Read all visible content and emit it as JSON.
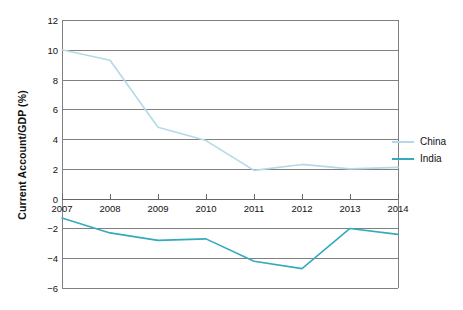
{
  "chart_data": {
    "type": "line",
    "title": "",
    "xlabel": "",
    "ylabel": "Current Account/GDP (%)",
    "categories": [
      "2007",
      "2008",
      "2009",
      "2010",
      "2011",
      "2012",
      "2013",
      "2014"
    ],
    "x": [
      2007,
      2008,
      2009,
      2010,
      2011,
      2012,
      2013,
      2014
    ],
    "ylim": [
      -6,
      12
    ],
    "xlim": [
      2007,
      2014
    ],
    "yticks": [
      12,
      10,
      8,
      6,
      4,
      2,
      0,
      -2,
      -4,
      -6
    ],
    "ytick_labels": [
      "12",
      "10",
      "8",
      "6",
      "4",
      "2",
      "0",
      "−2",
      "−4",
      "−6"
    ],
    "grid": true,
    "legend_position": "right",
    "series": [
      {
        "name": "China",
        "color": "#b5d9e8",
        "values": [
          10.0,
          9.3,
          4.8,
          3.9,
          1.9,
          2.3,
          2.0,
          2.1
        ]
      },
      {
        "name": "India",
        "color": "#35a9bd",
        "values": [
          -1.3,
          -2.3,
          -2.8,
          -2.7,
          -4.2,
          -4.7,
          -2.0,
          -2.4
        ]
      }
    ]
  },
  "legend": {
    "items": [
      {
        "label": "China",
        "color": "#b5d9e8"
      },
      {
        "label": "India",
        "color": "#35a9bd"
      }
    ]
  },
  "colors": {
    "china": "#b5d9e8",
    "india": "#35a9bd",
    "grid": "#808080",
    "axis": "#666666",
    "text": "#111111",
    "background": "#ffffff"
  }
}
